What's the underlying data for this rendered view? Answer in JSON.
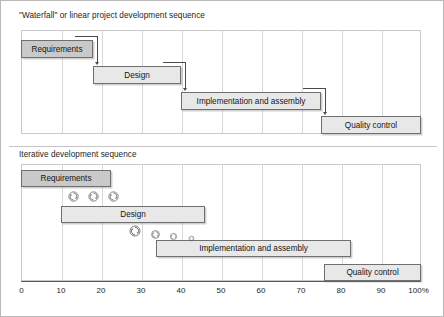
{
  "figure": {
    "width": 444,
    "height": 317,
    "border_color": "#b9b9b9"
  },
  "panels": [
    {
      "id": "waterfall",
      "title": "\"Waterfall\" or linear project development sequence",
      "phases": [
        {
          "label": "Requirements",
          "start": 0,
          "end": 18,
          "row": 0,
          "shade": "dark"
        },
        {
          "label": "Design",
          "start": 18,
          "end": 40,
          "row": 1,
          "shade": "light"
        },
        {
          "label": "Implementation and assembly",
          "start": 40,
          "end": 75,
          "row": 2,
          "shade": "light"
        },
        {
          "label": "Quality control",
          "start": 75,
          "end": 100,
          "row": 3,
          "shade": "light"
        }
      ],
      "connectors": [
        {
          "from": "Requirements",
          "to": "Design"
        },
        {
          "from": "Design",
          "to": "Implementation and assembly"
        },
        {
          "from": "Implementation and assembly",
          "to": "Quality control"
        }
      ]
    },
    {
      "id": "iterative",
      "title": "Iterative development sequence",
      "phases": [
        {
          "label": "Requirements",
          "start": 0,
          "end": 22.5,
          "row": 0,
          "shade": "dark"
        },
        {
          "label": "Design",
          "start": 10,
          "end": 46,
          "row": 1,
          "shade": "light"
        },
        {
          "label": "Implementation and assembly",
          "start": 33.8,
          "end": 82.5,
          "row": 2,
          "shade": "light"
        },
        {
          "label": "Quality control",
          "start": 75.8,
          "end": 100,
          "row": 3,
          "shade": "light"
        }
      ],
      "iteration_markers": [
        {
          "row": 0,
          "at": 13.0,
          "size": 13
        },
        {
          "row": 0,
          "at": 18.0,
          "size": 13
        },
        {
          "row": 0,
          "at": 23.0,
          "size": 13
        },
        {
          "row": 1,
          "at": 28.5,
          "size": 14
        },
        {
          "row": 1,
          "at": 33.5,
          "size": 11
        },
        {
          "row": 1,
          "at": 38.0,
          "size": 9
        },
        {
          "row": 1,
          "at": 42.5,
          "size": 7
        }
      ]
    }
  ],
  "axis": {
    "min": 0,
    "max": 100,
    "ticks": [
      0,
      10,
      20,
      30,
      40,
      50,
      60,
      70,
      80,
      90,
      100
    ],
    "tick_labels": [
      "0",
      "10",
      "20",
      "30",
      "40",
      "50",
      "60",
      "70",
      "80",
      "90",
      "100%"
    ]
  },
  "colors": {
    "bar_fill_light": "#e8e8e8",
    "bar_fill_dark": "#c9c9c9",
    "bar_border": "#6f6f6f",
    "grid": "#d8d8d8",
    "frame": "#c9c9c9",
    "connector": "#4a4a4a",
    "text": "#1d1d1d"
  },
  "icons": {
    "iteration": "cycle-arrows-icon"
  }
}
